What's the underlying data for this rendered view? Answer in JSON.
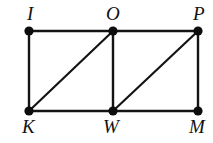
{
  "figure": {
    "type": "geometry-diagram",
    "background_color": "#ffffff",
    "line_color": "#141414",
    "vertex_color": "#0d0d0d",
    "width": 213,
    "height": 143,
    "vertices": [
      {
        "label": "I",
        "x": 29,
        "y": 31,
        "label_x": 27,
        "label_y": 4,
        "label_position": "above"
      },
      {
        "label": "O",
        "x": 113,
        "y": 31,
        "label_x": 106,
        "label_y": 4,
        "label_position": "above"
      },
      {
        "label": "P",
        "x": 198,
        "y": 31,
        "label_x": 193,
        "label_y": 4,
        "label_position": "above"
      },
      {
        "label": "K",
        "x": 29,
        "y": 111,
        "label_x": 22,
        "label_y": 117,
        "label_position": "below"
      },
      {
        "label": "W",
        "x": 113,
        "y": 111,
        "label_x": 103,
        "label_y": 117,
        "label_position": "below"
      },
      {
        "label": "M",
        "x": 198,
        "y": 111,
        "label_x": 189,
        "label_y": 117,
        "label_position": "below"
      }
    ],
    "edges": [
      {
        "name": "segment-IO",
        "from": "I",
        "to": "O",
        "x1": 29,
        "y1": 31,
        "x2": 113,
        "y2": 31,
        "kind": "side"
      },
      {
        "name": "segment-OP",
        "from": "O",
        "to": "P",
        "x1": 113,
        "y1": 31,
        "x2": 198,
        "y2": 31,
        "kind": "side"
      },
      {
        "name": "segment-KW",
        "from": "K",
        "to": "W",
        "x1": 29,
        "y1": 111,
        "x2": 113,
        "y2": 111,
        "kind": "side"
      },
      {
        "name": "segment-WM",
        "from": "W",
        "to": "M",
        "x1": 113,
        "y1": 111,
        "x2": 198,
        "y2": 111,
        "kind": "side"
      },
      {
        "name": "segment-IK",
        "from": "I",
        "to": "K",
        "x1": 29,
        "y1": 31,
        "x2": 29,
        "y2": 111,
        "kind": "side"
      },
      {
        "name": "segment-OW",
        "from": "O",
        "to": "W",
        "x1": 113,
        "y1": 31,
        "x2": 113,
        "y2": 111,
        "kind": "side"
      },
      {
        "name": "segment-PM",
        "from": "P",
        "to": "M",
        "x1": 198,
        "y1": 31,
        "x2": 198,
        "y2": 111,
        "kind": "side"
      },
      {
        "name": "segment-KO",
        "from": "K",
        "to": "O",
        "x1": 29,
        "y1": 111,
        "x2": 113,
        "y2": 31,
        "kind": "diagonal"
      },
      {
        "name": "segment-WP",
        "from": "W",
        "to": "P",
        "x1": 113,
        "y1": 111,
        "x2": 198,
        "y2": 31,
        "kind": "diagonal"
      }
    ],
    "vertex_radius": 4.6
  }
}
